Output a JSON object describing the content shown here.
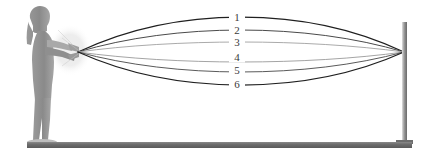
{
  "figure": {
    "background_color": "#ffffff",
    "width": 433,
    "height": 163
  },
  "ground": {
    "name": "ground-line",
    "color": "#6e6e6e",
    "edge_color": "#4d4d4d",
    "x": 27,
    "y": 142,
    "width": 385,
    "height": 6
  },
  "person": {
    "name": "person-silhouette",
    "description": "side view silhouette of a woman with long hair holding a light source with both arms extended forward",
    "color": "#8c8c8c",
    "hair_color": "#7d7d7d",
    "shadow_color": "#b5b5b5"
  },
  "light_source": {
    "name": "light-source",
    "description": "handheld light emitter held in the extended hands",
    "glow_color": "#d8d8d8",
    "origin_x": 78,
    "origin_y": 52
  },
  "pole": {
    "name": "vertical-pole",
    "color_light": "#bdbdbd",
    "color_dark": "#6a6a6a",
    "x": 404,
    "top_y": 22,
    "bottom_y": 143,
    "width": 5
  },
  "chart_data": {
    "type": "line",
    "xlabel": "",
    "ylabel": "",
    "grid": false,
    "legend_position": "inline-labels",
    "x_start": 78,
    "x_end": 404,
    "y_converge": 52,
    "series": [
      {
        "name": "1",
        "label": "1",
        "label_x": 237,
        "label_y": 17,
        "apex_y": 17,
        "color": "#1f1f1f",
        "stroke_width": 1.25
      },
      {
        "name": "2",
        "label": "2",
        "label_x": 237,
        "label_y": 30,
        "apex_y": 30,
        "color": "#4a4a4a",
        "stroke_width": 1.0
      },
      {
        "name": "3",
        "label": "3",
        "label_x": 237,
        "label_y": 42,
        "apex_y": 42,
        "color": "#a0a0a0",
        "stroke_width": 0.9
      },
      {
        "name": "4",
        "label": "4",
        "label_x": 237,
        "label_y": 57,
        "apex_y": 62,
        "color": "#9a9a9a",
        "stroke_width": 0.9
      },
      {
        "name": "5",
        "label": "5",
        "label_x": 237,
        "label_y": 70,
        "apex_y": 72,
        "color": "#5a5a5a",
        "stroke_width": 1.0
      },
      {
        "name": "6",
        "label": "6",
        "label_x": 237,
        "label_y": 84,
        "apex_y": 85,
        "color": "#1f1f1f",
        "stroke_width": 1.25
      }
    ]
  }
}
